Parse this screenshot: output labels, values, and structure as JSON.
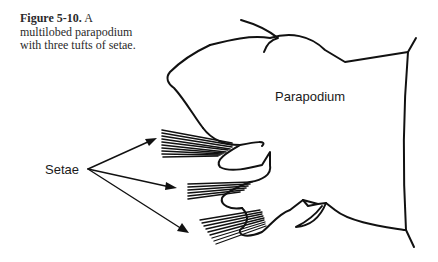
{
  "figure": {
    "number": "Figure 5-10.",
    "caption": "A multilobed parapodium with three tufts of setae."
  },
  "labels": {
    "parapodium": "Parapodium",
    "setae": "Setae"
  },
  "colors": {
    "ink": "#111111",
    "text": "#2a2a2a",
    "background": "#ffffff"
  }
}
